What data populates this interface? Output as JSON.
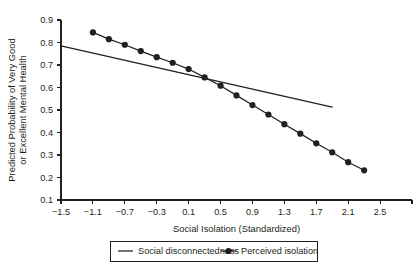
{
  "chart_data": {
    "type": "line",
    "title": "",
    "xlabel": "Social Isolation (Standardized)",
    "ylabel": "Predicted Probability of Very Good or Excellent Mental Health",
    "ylabel_line1": "Predicted Probability of Very Good",
    "ylabel_line2": "or Excellent Mental Health",
    "xlim": [
      -1.5,
      2.9
    ],
    "ylim": [
      0.1,
      0.9
    ],
    "xticks": [
      -1.5,
      -1.1,
      -0.7,
      -0.3,
      0.1,
      0.5,
      0.9,
      1.3,
      1.7,
      2.1,
      2.5
    ],
    "xticklabels": [
      "−1.5",
      "−1.1",
      "−0.7",
      "−0.3",
      "0.1",
      "0.5",
      "0.9",
      "1.3",
      "1.7",
      "2.1",
      "2.5"
    ],
    "yticks": [
      0.1,
      0.2,
      0.3,
      0.4,
      0.5,
      0.6,
      0.7,
      0.8,
      0.9
    ],
    "yticklabels": [
      "0.1",
      "0.2",
      "0.3",
      "0.4",
      "0.5",
      "0.6",
      "0.7",
      "0.8",
      "0.9"
    ],
    "grid": false,
    "legend_position": "below-axes",
    "series": [
      {
        "name": "Social disconnectedness",
        "marker": "none",
        "color": "#231f20",
        "x": [
          -1.5,
          1.9
        ],
        "y": [
          0.785,
          0.513
        ]
      },
      {
        "name": "Perceived isolation",
        "marker": "filled-circle",
        "color": "#231f20",
        "x": [
          -1.1,
          -0.9,
          -0.7,
          -0.5,
          -0.3,
          -0.1,
          0.1,
          0.3,
          0.5,
          0.7,
          0.9,
          1.1,
          1.3,
          1.5,
          1.7,
          1.9,
          2.1,
          2.3
        ],
        "y": [
          0.845,
          0.815,
          0.79,
          0.762,
          0.735,
          0.71,
          0.682,
          0.645,
          0.608,
          0.565,
          0.522,
          0.48,
          0.437,
          0.395,
          0.352,
          0.312,
          0.268,
          0.232
        ]
      }
    ]
  },
  "legend": {
    "entries": [
      {
        "label": "Social disconnectedness",
        "style": "line"
      },
      {
        "label": "Perceived isolation",
        "style": "line-marker"
      }
    ]
  }
}
